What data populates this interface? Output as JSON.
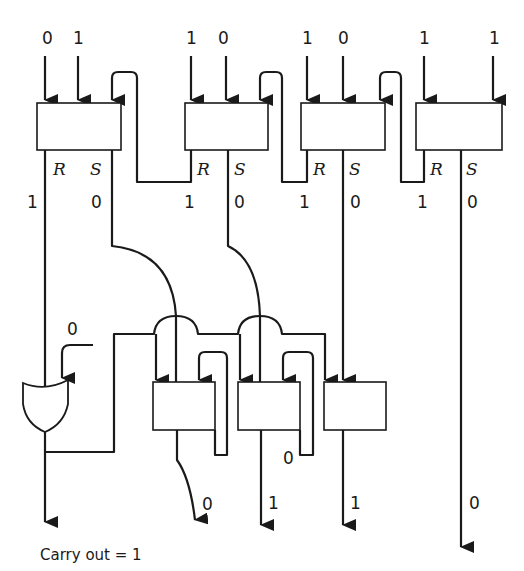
{
  "inputs": {
    "cell1": [
      "0",
      "1"
    ],
    "cell2": [
      "1",
      "0"
    ],
    "cell3": [
      "1",
      "0"
    ],
    "cell4": [
      "1",
      "1"
    ]
  },
  "port_labels": {
    "r": "R",
    "s": "S"
  },
  "rs_values": [
    {
      "r": "1",
      "s": "0"
    },
    {
      "r": "1",
      "s": "0"
    },
    {
      "r": "1",
      "s": "0"
    },
    {
      "r": "1",
      "s": "0"
    }
  ],
  "or_gate_input": "0",
  "mid_value": "0",
  "outputs": [
    "0",
    "1",
    "1",
    "0"
  ],
  "caption": "Carry out = 1"
}
